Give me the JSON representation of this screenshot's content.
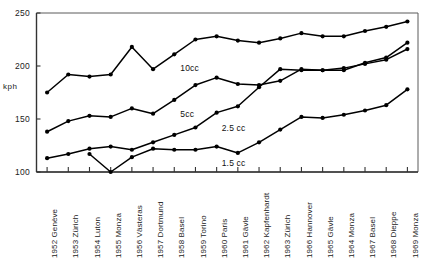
{
  "chart_data": {
    "type": "line",
    "title": "",
    "xlabel": "",
    "ylabel": "kph",
    "ylim": [
      100,
      250
    ],
    "yticks": [
      100,
      150,
      200,
      250
    ],
    "ytick_labels": [
      "100",
      "150",
      "200",
      "250"
    ],
    "grid": false,
    "legend_position": "inline-right-of-line",
    "categories": [
      "1952 Genève",
      "1953 Zürich",
      "1954 Luton",
      "1955 Monza",
      "1956 Västeras",
      "1957 Dortmund",
      "1958 Basel",
      "1959 Torino",
      "1960 Paris",
      "1961 Gävle",
      "1962 Kapfenhardt",
      "1963 Zürich",
      "1966 Hannover",
      "1965 Gävle",
      "1964 Monza",
      "1967 Basel",
      "1968 Dieppe",
      "1969 Monza"
    ],
    "series": [
      {
        "name": "10cc",
        "label": "10cc",
        "values": [
          175,
          192,
          190,
          192,
          218,
          197,
          211,
          225,
          228,
          224,
          222,
          226,
          231,
          228,
          228,
          233,
          237,
          242
        ]
      },
      {
        "name": "5cc",
        "label": "5cc",
        "values": [
          138,
          148,
          153,
          152,
          160,
          155,
          168,
          182,
          189,
          183,
          182,
          186,
          197,
          196,
          196,
          203,
          208,
          222
        ]
      },
      {
        "name": "2.5cc",
        "label": "2.5 cc",
        "values": [
          113,
          117,
          122,
          124,
          121,
          128,
          135,
          142,
          156,
          162,
          180,
          197,
          196,
          196,
          198,
          202,
          206,
          216
        ]
      },
      {
        "name": "1.5cc",
        "label": "1.5 cc",
        "values": [
          null,
          null,
          117,
          100,
          114,
          122,
          121,
          121,
          124,
          118,
          128,
          140,
          152,
          151,
          154,
          158,
          163,
          178
        ]
      }
    ]
  }
}
